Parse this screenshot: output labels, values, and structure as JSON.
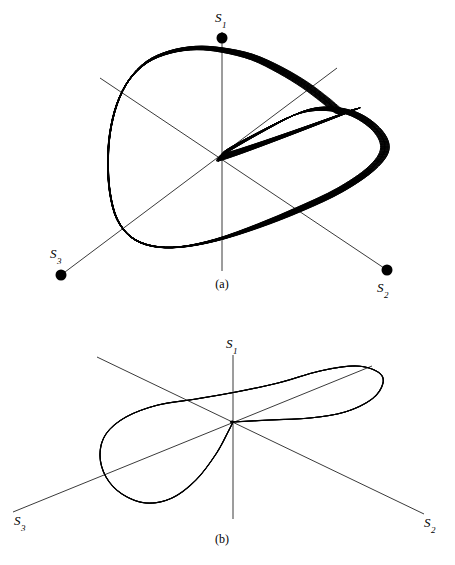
{
  "figure": {
    "background_color": "#ffffff",
    "line_color": "#000000",
    "axis_color": "#3a3a3a",
    "panels": [
      {
        "caption": "(a)",
        "caption_x": 222,
        "caption_y": 288,
        "origin": {
          "x": 222,
          "y": 157
        },
        "axes": [
          {
            "name": "S1",
            "label": "S",
            "subscript": "1",
            "label_x": 215,
            "label_y": 22,
            "from": {
              "x": 222,
              "y": 271
            },
            "to": {
              "x": 222,
              "y": 32
            },
            "endpoint_dot": {
              "x": 222,
              "y": 38,
              "r": 5.5
            }
          },
          {
            "name": "S2",
            "label": "S",
            "subscript": "2",
            "label_x": 377,
            "label_y": 292,
            "from": {
              "x": 100,
              "y": 78
            },
            "to": {
              "x": 387,
              "y": 270
            },
            "endpoint_dot": {
              "x": 387,
              "y": 270,
              "r": 5.5
            }
          },
          {
            "name": "S3",
            "label": "S",
            "subscript": "3",
            "label_x": 50,
            "label_y": 258,
            "from": {
              "x": 337,
              "y": 68
            },
            "to": {
              "x": 61,
              "y": 275
            },
            "endpoint_dot": {
              "x": 61,
              "y": 275,
              "r": 5.5
            }
          }
        ]
      },
      {
        "caption": "(b)",
        "caption_x": 222,
        "caption_y": 543,
        "origin": {
          "x": 233,
          "y": 422
        },
        "axes": [
          {
            "name": "S1",
            "label": "S",
            "subscript": "1",
            "label_x": 226,
            "label_y": 348,
            "from": {
              "x": 233,
              "y": 519
            },
            "to": {
              "x": 233,
              "y": 355
            },
            "endpoint_dot": null
          },
          {
            "name": "S2",
            "label": "S",
            "subscript": "2",
            "label_x": 424,
            "label_y": 527,
            "from": {
              "x": 97,
              "y": 357
            },
            "to": {
              "x": 424,
              "y": 514
            },
            "endpoint_dot": null
          },
          {
            "name": "S3",
            "label": "S",
            "subscript": "3",
            "label_x": 14,
            "label_y": 525,
            "from": {
              "x": 372,
              "y": 366
            },
            "to": {
              "x": 13,
              "y": 512
            },
            "endpoint_dot": null
          }
        ]
      }
    ]
  },
  "chart_data": {
    "type": "line",
    "title": "",
    "subtitle": "",
    "xlabel": "",
    "ylabel": "",
    "grid": false,
    "legend": null,
    "panels": [
      {
        "caption": "(a)",
        "kind": "quasi-periodic torus orbit",
        "axis_names": [
          "S1",
          "S2",
          "S3"
        ],
        "n_windings": 26,
        "band_thickness_px": 11,
        "closed": true,
        "outline_path_points": [
          [
            222,
            157
          ],
          [
            268,
            128
          ],
          [
            310,
            110
          ],
          [
            348,
            112
          ],
          [
            375,
            128
          ],
          [
            385,
            148
          ],
          [
            372,
            168
          ],
          [
            340,
            190
          ],
          [
            300,
            209
          ],
          [
            258,
            226
          ],
          [
            216,
            240
          ],
          [
            180,
            247
          ],
          [
            152,
            246
          ],
          [
            131,
            237
          ],
          [
            117,
            219
          ],
          [
            110,
            193
          ],
          [
            108,
            163
          ],
          [
            110,
            133
          ],
          [
            117,
            104
          ],
          [
            129,
            80
          ],
          [
            147,
            62
          ],
          [
            170,
            52
          ],
          [
            196,
            48
          ],
          [
            222,
            50
          ],
          [
            252,
            57
          ],
          [
            280,
            70
          ],
          [
            305,
            85
          ],
          [
            325,
            100
          ],
          [
            340,
            112
          ],
          [
            348,
            112
          ]
        ],
        "thick_band_region": {
          "description": "dense bundle of near-parallel windings along the left/lower-left edge",
          "from_point": [
            129,
            80
          ],
          "to_point": [
            180,
            247
          ]
        }
      },
      {
        "caption": "(b)",
        "kind": "periodic limit-cycle orbit",
        "axis_names": [
          "S1",
          "S2",
          "S3"
        ],
        "n_windings": 3,
        "band_thickness_px": 3,
        "closed": true,
        "outline_path_points": [
          [
            233,
            422
          ],
          [
            270,
            420
          ],
          [
            310,
            418
          ],
          [
            345,
            412
          ],
          [
            372,
            399
          ],
          [
            383,
            383
          ],
          [
            378,
            372
          ],
          [
            356,
            366
          ],
          [
            320,
            371
          ],
          [
            278,
            383
          ],
          [
            236,
            392
          ],
          [
            196,
            399
          ],
          [
            158,
            405
          ],
          [
            126,
            417
          ],
          [
            106,
            434
          ],
          [
            100,
            455
          ],
          [
            106,
            477
          ],
          [
            122,
            494
          ],
          [
            146,
            503
          ],
          [
            172,
            498
          ],
          [
            196,
            480
          ],
          [
            216,
            454
          ],
          [
            228,
            432
          ],
          [
            233,
            422
          ]
        ],
        "thick_band_region": {
          "description": "overlapping strands just right of the origin, running nearly horizontally",
          "from_point": [
            233,
            422
          ],
          "to_point": [
            330,
            418
          ]
        }
      }
    ]
  }
}
